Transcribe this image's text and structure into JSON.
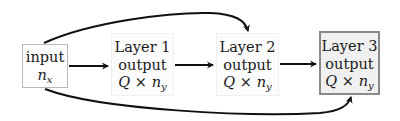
{
  "diagram": {
    "type": "flow",
    "nodes": [
      {
        "id": "input",
        "line1": "input",
        "var": "n",
        "sub": "x"
      },
      {
        "id": "layer1",
        "line1": "Layer 1",
        "line2": "output",
        "dim_q": "Q",
        "times": "×",
        "var": "n",
        "sub": "y"
      },
      {
        "id": "layer2",
        "line1": "Layer 2",
        "line2": "output",
        "dim_q": "Q",
        "times": "×",
        "var": "n",
        "sub": "y"
      },
      {
        "id": "layer3",
        "line1": "Layer 3",
        "line2": "output",
        "dim_q": "Q",
        "times": "×",
        "var": "n",
        "sub": "y",
        "highlighted": true
      }
    ],
    "edges": [
      {
        "from": "input",
        "to": "layer1",
        "style": "straight"
      },
      {
        "from": "layer1",
        "to": "layer2",
        "style": "straight"
      },
      {
        "from": "layer2",
        "to": "layer3",
        "style": "straight"
      },
      {
        "from": "input",
        "to": "layer2",
        "style": "curved-top"
      },
      {
        "from": "input",
        "to": "layer3",
        "style": "curved-bottom"
      }
    ],
    "colors": {
      "edge": "#111111",
      "layer3_border": "#8a8a8a",
      "layer3_fill": "#f0f0f0",
      "input_border": "#b8b8b8"
    }
  }
}
